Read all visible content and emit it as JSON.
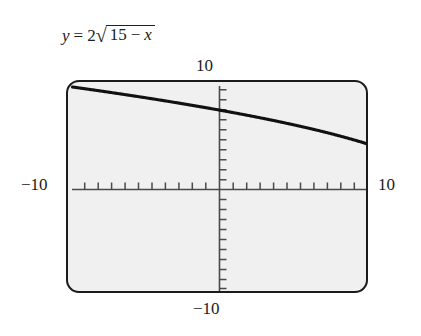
{
  "equation": {
    "lhs": "y",
    "equals": "=",
    "coefficient": "2",
    "radical_sign": "√",
    "radicand_first": "15",
    "radicand_op": "−",
    "radicand_var": "x",
    "full_text": "y = 2√(15 − x)"
  },
  "labels": {
    "y_top": "10",
    "y_bottom": "−10",
    "x_left": "−10",
    "x_right": "10"
  },
  "colors": {
    "screen_background": "#f0f0f0",
    "frame_border": "#1b1b1b",
    "curve": "#111111",
    "axis": "#4a4a4a",
    "text": "#202020",
    "page_background": "#ffffff"
  },
  "chart_data": {
    "type": "line",
    "title": "",
    "subtitle": "",
    "xlabel": "",
    "ylabel": "",
    "equation": "y = 2*sqrt(15 - x)",
    "xlim": [
      -10,
      10
    ],
    "ylim": [
      -10,
      10
    ],
    "grid": false,
    "legend": null,
    "axis_ticks": {
      "x_major_interval": 1,
      "y_major_interval": 1,
      "x_tick_values": [
        -9,
        -8,
        -7,
        -6,
        -5,
        -4,
        -3,
        -2,
        -1,
        1,
        2,
        3,
        4,
        5,
        6,
        7,
        8,
        9
      ],
      "y_tick_values": [
        -9,
        -8,
        -7,
        -6,
        -5,
        -4,
        -3,
        -2,
        -1,
        1,
        2,
        3,
        4,
        5,
        6,
        7,
        8,
        9
      ],
      "x_axis_labels": [
        "−10",
        "10"
      ],
      "y_axis_labels": [
        "−10",
        "10"
      ]
    },
    "series": [
      {
        "name": "y = 2√(15 − x)",
        "x": [
          -10,
          -9,
          -8,
          -7,
          -6,
          -5,
          -4,
          -3,
          -2,
          -1,
          0,
          1,
          2,
          3,
          4,
          5,
          6,
          7,
          8,
          9,
          10
        ],
        "y": [
          10.0,
          9.8,
          9.59,
          9.38,
          9.17,
          8.94,
          8.72,
          8.49,
          8.25,
          8.0,
          7.75,
          7.48,
          7.21,
          6.93,
          6.63,
          6.32,
          6.0,
          5.66,
          5.29,
          4.9,
          4.47
        ]
      }
    ],
    "annotations": [
      {
        "text": "curve enters screen at upper-left and descends to the right edge"
      }
    ]
  }
}
